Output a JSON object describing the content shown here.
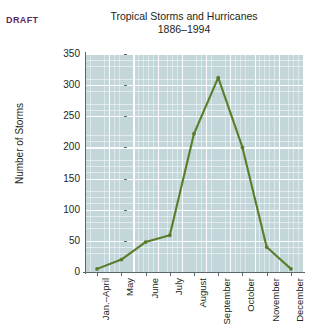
{
  "annotations": {
    "draft_stamp": "DRAFT",
    "draft_color": "#5b2b5e"
  },
  "chart_data": {
    "type": "line",
    "title": "Tropical Storms and Hurricanes",
    "subtitle": "1886–1994",
    "xlabel": "",
    "ylabel": "Number of Storms",
    "categories": [
      "Jan.–April",
      "May",
      "June",
      "July",
      "August",
      "September",
      "October",
      "November",
      "December"
    ],
    "values": [
      5,
      20,
      48,
      59,
      222,
      312,
      200,
      40,
      5
    ],
    "ylim": [
      0,
      350
    ],
    "yticks": [
      0,
      50,
      100,
      150,
      200,
      250,
      300,
      350
    ],
    "ytick_labels": [
      "0",
      "50",
      "100",
      "150",
      "200",
      "250",
      "300",
      "350"
    ],
    "grid": true,
    "grid_minor_step": 10,
    "legend": "none",
    "series_color": "#5a7d2a",
    "plot_background": "#c3d6da",
    "gridline_color": "#ffffff",
    "axis_color": "#5a676b"
  }
}
